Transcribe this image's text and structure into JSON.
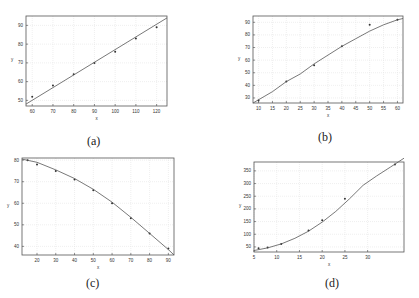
{
  "captions": {
    "a": "(a)",
    "b": "(b)",
    "c": "(c)",
    "d": "(d)"
  },
  "chart_data": [
    {
      "id": "a",
      "type": "scatter",
      "title": "",
      "xlabel": "x",
      "ylabel": "y",
      "xlim": [
        57,
        125
      ],
      "ylim": [
        47,
        95
      ],
      "xticks": [
        60,
        70,
        80,
        90,
        100,
        110,
        120
      ],
      "yticks": [
        50,
        60,
        70,
        80,
        90
      ],
      "grid": true,
      "series": [
        {
          "name": "data",
          "style": "markers",
          "x": [
            60,
            70,
            80,
            90,
            100,
            110,
            120
          ],
          "y": [
            52,
            58,
            64,
            70,
            76,
            83,
            89
          ]
        },
        {
          "name": "fit",
          "style": "line",
          "x": [
            57,
            125
          ],
          "y": [
            48,
            94
          ]
        }
      ],
      "caption": "(a)"
    },
    {
      "id": "b",
      "type": "scatter",
      "title": "",
      "xlabel": "x",
      "ylabel": "y",
      "xlim": [
        8,
        62
      ],
      "ylim": [
        26,
        95
      ],
      "xticks": [
        10,
        15,
        20,
        25,
        30,
        35,
        40,
        45,
        50,
        55,
        60
      ],
      "yticks": [
        30,
        40,
        50,
        60,
        70,
        80,
        90
      ],
      "grid": true,
      "series": [
        {
          "name": "data",
          "style": "markers",
          "x": [
            10,
            20,
            30,
            40,
            50,
            60
          ],
          "y": [
            28,
            43,
            56,
            71,
            88,
            92
          ]
        },
        {
          "name": "fit",
          "style": "line",
          "x": [
            8,
            15,
            20,
            25,
            30,
            35,
            40,
            45,
            50,
            55,
            60,
            62
          ],
          "y": [
            26,
            35,
            43,
            49,
            57,
            64,
            71,
            77,
            83,
            88,
            92,
            93
          ]
        }
      ],
      "caption": "(b)"
    },
    {
      "id": "c",
      "type": "scatter",
      "title": "",
      "xlabel": "x",
      "ylabel": "y",
      "xlim": [
        12,
        93
      ],
      "ylim": [
        36,
        81
      ],
      "xticks": [
        20,
        30,
        40,
        50,
        60,
        70,
        80,
        90
      ],
      "yticks": [
        40,
        50,
        60,
        70,
        80
      ],
      "grid": true,
      "series": [
        {
          "name": "data",
          "style": "markers",
          "x": [
            15,
            20,
            30,
            40,
            50,
            60,
            70,
            80,
            90
          ],
          "y": [
            80,
            78,
            75,
            71,
            66,
            60,
            53,
            46,
            39
          ]
        },
        {
          "name": "fit",
          "style": "line",
          "x": [
            12,
            20,
            30,
            40,
            50,
            60,
            70,
            80,
            90,
            93
          ],
          "y": [
            80.5,
            79,
            75.5,
            71.5,
            66.5,
            60.5,
            53.5,
            46,
            38.5,
            36
          ]
        }
      ],
      "caption": "(c)"
    },
    {
      "id": "d",
      "type": "scatter",
      "title": "",
      "xlabel": "x",
      "ylabel": "y",
      "xlim": [
        5,
        38
      ],
      "ylim": [
        30,
        385
      ],
      "xticks": [
        5,
        10,
        15,
        20,
        25,
        30
      ],
      "yticks": [
        50,
        100,
        150,
        200,
        250,
        300,
        350
      ],
      "grid": true,
      "series": [
        {
          "name": "data",
          "style": "markers",
          "x": [
            6,
            8,
            11,
            17,
            20,
            25,
            36
          ],
          "y": [
            45,
            48,
            62,
            115,
            155,
            240,
            375
          ]
        },
        {
          "name": "fit",
          "style": "line",
          "x": [
            5,
            8,
            11,
            14,
            17,
            20,
            23,
            26,
            29,
            32,
            35,
            38
          ],
          "y": [
            36,
            46,
            62,
            84,
            112,
            148,
            190,
            240,
            293,
            330,
            365,
            400
          ]
        }
      ],
      "caption": "(d)"
    }
  ]
}
